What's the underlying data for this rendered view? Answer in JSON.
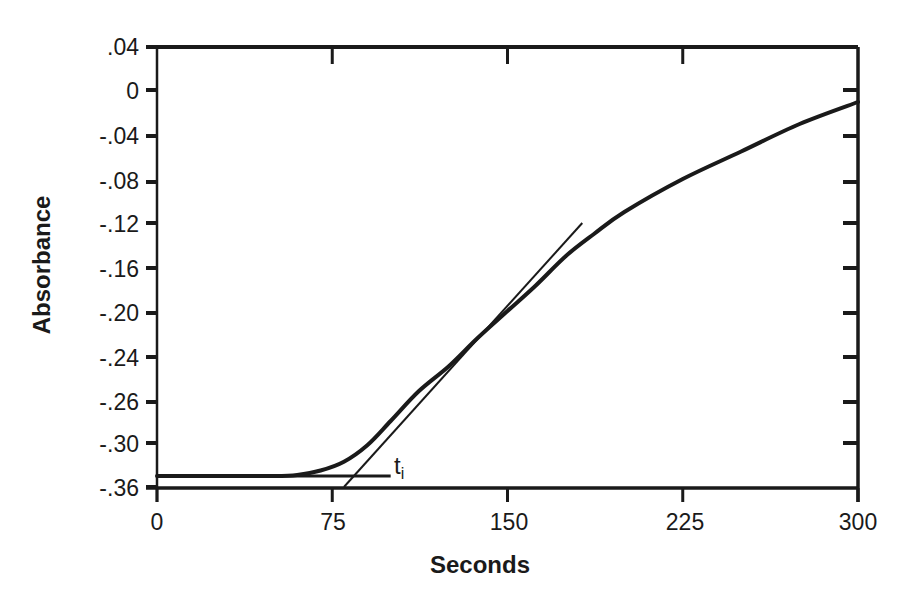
{
  "chart_data": {
    "type": "line",
    "title": "",
    "xlabel": "Seconds",
    "ylabel": "Absorbance",
    "xlim": [
      0,
      300
    ],
    "ylim": [
      -0.36,
      0.04
    ],
    "grid": false,
    "legend": null,
    "x_ticks": [
      {
        "value": 0,
        "label": "0"
      },
      {
        "value": 75,
        "label": "75"
      },
      {
        "value": 150,
        "label": "150"
      },
      {
        "value": 225,
        "label": "225"
      },
      {
        "value": 300,
        "label": "300"
      }
    ],
    "y_ticks": [
      {
        "label": ".04"
      },
      {
        "label": "0"
      },
      {
        "label": "-.04"
      },
      {
        "label": "-.08"
      },
      {
        "label": "-.12"
      },
      {
        "label": "-.16"
      },
      {
        "label": "-.20"
      },
      {
        "label": "-.24"
      },
      {
        "label": "-.26"
      },
      {
        "label": "-.30"
      },
      {
        "label": "-.36"
      }
    ],
    "series": [
      {
        "name": "absorbance curve",
        "x": [
          0,
          25,
          50,
          60,
          70,
          80,
          90,
          100,
          112,
          125,
          137,
          150,
          162,
          175,
          187,
          200,
          225,
          250,
          275,
          300
        ],
        "values": [
          -0.35,
          -0.35,
          -0.35,
          -0.349,
          -0.345,
          -0.337,
          -0.322,
          -0.3,
          -0.273,
          -0.25,
          -0.225,
          -0.2,
          -0.177,
          -0.15,
          -0.13,
          -0.11,
          -0.08,
          -0.055,
          -0.03,
          -0.01
        ]
      }
    ],
    "annotations": [
      {
        "type": "line",
        "name": "baseline",
        "x": [
          0,
          100
        ],
        "values": [
          -0.35,
          -0.35
        ]
      },
      {
        "type": "line",
        "name": "tangent",
        "x": [
          80,
          182
        ],
        "values": [
          -0.36,
          -0.12
        ]
      },
      {
        "type": "text",
        "label": "t",
        "subscript": "i",
        "x": 101,
        "y": -0.345
      }
    ]
  }
}
